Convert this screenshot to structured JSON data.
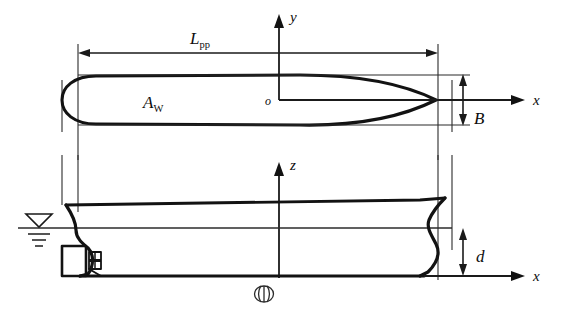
{
  "figure": {
    "background_color": "#ffffff",
    "line_color": "#121212",
    "width": 567,
    "height": 312
  },
  "views": {
    "plan": {
      "name": "waterplane-view",
      "area_label": "A",
      "area_subscript": "W",
      "length_label": "L",
      "length_subscript": "pp",
      "beam_label": "B",
      "axis_y": "y",
      "axis_x": "x",
      "origin": "o"
    },
    "profile": {
      "name": "sheer-profile-view",
      "draught_label": "d",
      "axis_z": "z",
      "axis_x": "x",
      "midship_symbol": "midship-section-symbol",
      "waterline_symbol": "waterline-level-symbol"
    }
  },
  "annotations": [
    {
      "id": "lpp",
      "text": "L",
      "subscript": "pp",
      "meaning": "length between perpendiculars"
    },
    {
      "id": "aw",
      "text": "A",
      "subscript": "W",
      "meaning": "waterplane area"
    },
    {
      "id": "beam",
      "text": "B",
      "subscript": "",
      "meaning": "moulded breadth"
    },
    {
      "id": "draught",
      "text": "d",
      "subscript": "",
      "meaning": "draught"
    },
    {
      "id": "y-axis",
      "text": "y",
      "subscript": "",
      "meaning": "transverse axis"
    },
    {
      "id": "z-axis",
      "text": "z",
      "subscript": "",
      "meaning": "vertical axis"
    },
    {
      "id": "x-axis-plan",
      "text": "x",
      "subscript": "",
      "meaning": "longitudinal axis plan view"
    },
    {
      "id": "x-axis-profile",
      "text": "x",
      "subscript": "",
      "meaning": "longitudinal axis profile view"
    },
    {
      "id": "origin",
      "text": "o",
      "subscript": "",
      "meaning": "coordinate system origin"
    }
  ]
}
